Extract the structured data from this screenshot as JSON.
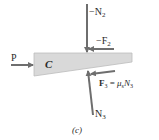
{
  "figure": {
    "caption": "(c)",
    "body_label": "C",
    "colors": {
      "wedge_fill": "#d9d9d9",
      "wedge_stroke": "#bdbdbd",
      "arrow": "#6e6e6e",
      "text": "#2a2a2a"
    },
    "forces": {
      "P": {
        "label": "P",
        "direction": "right"
      },
      "N2": {
        "label": "−N",
        "sub": "2",
        "direction": "down"
      },
      "F2": {
        "label": "−F",
        "sub": "2",
        "direction": "left"
      },
      "F3": {
        "label": "F",
        "sub": "3",
        "eq": " = ",
        "mu": "μ",
        "mu_sub": "s",
        "n": "N",
        "n_sub": "3",
        "direction": "left"
      },
      "N3": {
        "label": "N",
        "sub": "3",
        "direction": "up"
      }
    }
  }
}
